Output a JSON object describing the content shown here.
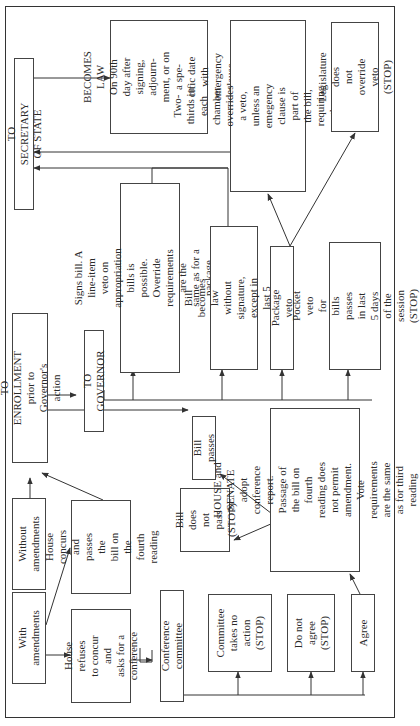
{
  "diagram": {
    "orientation": "rotated-90-ccw",
    "nodes": {
      "with_amendments": "With\namendments",
      "without_amendments": "Without\namendments",
      "house_refuses": "House refuses\nto concur and\nasks for a\nconference",
      "house_concurs": "House concurs\nand passes the\nbill on the\nfourth reading",
      "to_enrollment": "TO ENROLLMENT\nprior to Governor's action",
      "to_governor": "TO GOVERNOR",
      "to_secretary": "TO SECRETARY OF STATE",
      "becomes_law": "BECOMES LAW\nOn 90th day after\nsigning, adjourn-\nment, or on a spe-\ncific date with\nemergency clause",
      "signs_bill": "Signs bill. A line-item veto on\nappropriation bills is possible.\nOverride requirements are the\nsame as for a package veto.",
      "without_signature": "Bill becomes law\nwithout signature,\nexcept in last 5 days",
      "package_veto": "Package veto",
      "pocket_veto": "Pocket veto for bills\npasses in last 5 days\nof the session (STOP)",
      "two_thirds": "Two-thirds in each chamber\noverrides a veto, unless an\nemegency clause is part of\nthe bill, requiring a three-\nfourths vote",
      "legislature_no_override": "Legislature does\nnot override veto\n(STOP)",
      "bill_passes": "Bill passes",
      "bill_not_pass": "Bill does\nnot pass\n(STOP)",
      "house_senate_adopt": "HOUSE and SENATE\nadopt conference report.\nPassage of the bill on fourth\nreading does not permit\namendment. Vote\nrequirements are the same\nas for third reading",
      "conference_committee": "Conference committee",
      "committee_no_action": "Committee\ntakes no\naction\n(STOP)",
      "do_not_agree": "Do not\nagree\n(STOP)",
      "agree": "Agree"
    },
    "edges": [
      {
        "from": "without_amendments",
        "to": "to_enrollment"
      },
      {
        "from": "with_amendments",
        "to": "house_concurs"
      },
      {
        "from": "with_amendments",
        "to": "house_refuses"
      },
      {
        "from": "house_concurs",
        "to": "to_enrollment"
      },
      {
        "from": "house_refuses",
        "to": "conference_committee"
      },
      {
        "from": "conference_committee",
        "to": "committee_no_action"
      },
      {
        "from": "conference_committee",
        "to": "do_not_agree"
      },
      {
        "from": "conference_committee",
        "to": "agree"
      },
      {
        "from": "agree",
        "to": "house_senate_adopt"
      },
      {
        "from": "house_senate_adopt",
        "to": "bill_passes"
      },
      {
        "from": "house_senate_adopt",
        "to": "bill_not_pass"
      },
      {
        "from": "to_enrollment",
        "to": "bill_passes"
      },
      {
        "from": "to_enrollment",
        "to": "to_governor"
      },
      {
        "from": "to_governor",
        "to": "signs_bill"
      },
      {
        "from": "to_governor",
        "to": "without_signature"
      },
      {
        "from": "to_governor",
        "to": "package_veto"
      },
      {
        "from": "to_governor",
        "to": "pocket_veto"
      },
      {
        "from": "package_veto",
        "to": "two_thirds"
      },
      {
        "from": "package_veto",
        "to": "legislature_no_override"
      },
      {
        "from": "signs_bill",
        "to": "to_secretary"
      },
      {
        "from": "without_signature",
        "to": "to_secretary"
      },
      {
        "from": "two_thirds",
        "to": "to_secretary"
      },
      {
        "from": "to_secretary",
        "to": "becomes_law"
      }
    ],
    "colors": {
      "line": "#333333",
      "box_border": "#444444",
      "background": "#ffffff"
    }
  }
}
